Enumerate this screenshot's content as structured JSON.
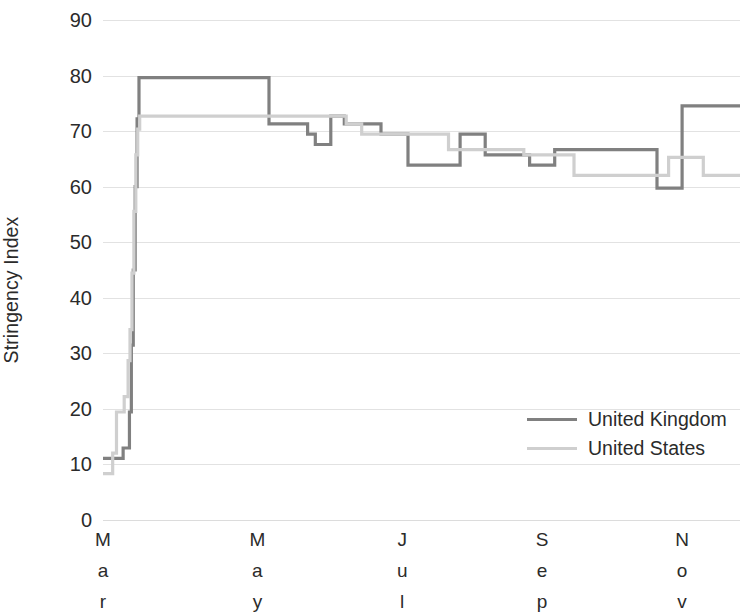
{
  "chart_data": {
    "type": "line",
    "title": "",
    "xlabel": "",
    "ylabel": "Stringency Index",
    "ylim": [
      0,
      90
    ],
    "y_ticks": [
      90,
      80,
      70,
      60,
      50,
      40,
      30,
      20,
      10,
      0
    ],
    "grid": true,
    "legend_position": "inside-right",
    "x_tick_labels": [
      "Mar",
      "May",
      "Jul",
      "Sep",
      "Nov"
    ],
    "x_tick_positions_frac": [
      0.0,
      0.2424,
      0.4697,
      0.6894,
      0.9091
    ],
    "x_range_label": "Mar 2020 - Nov 2020",
    "series": [
      {
        "name": "United Kingdom",
        "color": "#808080",
        "step": "post",
        "points": [
          [
            0.0,
            11.1
          ],
          [
            0.0286,
            11.1
          ],
          [
            0.0316,
            12.96
          ],
          [
            0.0385,
            12.96
          ],
          [
            0.0415,
            19.44
          ],
          [
            0.0445,
            31.48
          ],
          [
            0.0475,
            45.0
          ],
          [
            0.0505,
            60.0
          ],
          [
            0.0535,
            72.2
          ],
          [
            0.0565,
            79.63
          ],
          [
            0.2424,
            79.63
          ],
          [
            0.2545,
            79.63
          ],
          [
            0.2606,
            71.3
          ],
          [
            0.3091,
            71.3
          ],
          [
            0.3212,
            69.44
          ],
          [
            0.3333,
            67.59
          ],
          [
            0.3515,
            67.59
          ],
          [
            0.3576,
            72.69
          ],
          [
            0.3636,
            72.69
          ],
          [
            0.3788,
            71.3
          ],
          [
            0.4242,
            71.3
          ],
          [
            0.4364,
            69.44
          ],
          [
            0.4697,
            69.44
          ],
          [
            0.4788,
            63.89
          ],
          [
            0.5515,
            63.89
          ],
          [
            0.5606,
            69.44
          ],
          [
            0.5909,
            69.44
          ],
          [
            0.6,
            65.74
          ],
          [
            0.6591,
            65.74
          ],
          [
            0.6697,
            63.89
          ],
          [
            0.7,
            63.89
          ],
          [
            0.7091,
            66.67
          ],
          [
            0.7727,
            66.67
          ],
          [
            0.7848,
            66.67
          ],
          [
            0.8606,
            66.67
          ],
          [
            0.8697,
            59.72
          ],
          [
            0.9,
            59.72
          ],
          [
            0.9091,
            74.54
          ],
          [
            1.0,
            74.54
          ]
        ]
      },
      {
        "name": "United States",
        "color": "#cfcfcf",
        "step": "post",
        "points": [
          [
            0.0,
            8.33
          ],
          [
            0.0121,
            8.33
          ],
          [
            0.0152,
            12.04
          ],
          [
            0.0212,
            19.44
          ],
          [
            0.0303,
            19.44
          ],
          [
            0.0333,
            22.22
          ],
          [
            0.0394,
            28.7
          ],
          [
            0.0424,
            34.26
          ],
          [
            0.0455,
            44.44
          ],
          [
            0.0485,
            55.56
          ],
          [
            0.0515,
            65.74
          ],
          [
            0.0545,
            70.37
          ],
          [
            0.0576,
            72.69
          ],
          [
            0.2424,
            72.69
          ],
          [
            0.3,
            72.69
          ],
          [
            0.3394,
            72.69
          ],
          [
            0.3636,
            72.69
          ],
          [
            0.3818,
            71.3
          ],
          [
            0.4061,
            69.44
          ],
          [
            0.4545,
            69.44
          ],
          [
            0.4697,
            69.44
          ],
          [
            0.5303,
            69.44
          ],
          [
            0.5424,
            66.67
          ],
          [
            0.6515,
            66.67
          ],
          [
            0.6606,
            65.74
          ],
          [
            0.7273,
            65.74
          ],
          [
            0.7394,
            62.04
          ],
          [
            0.8788,
            62.04
          ],
          [
            0.8879,
            65.28
          ],
          [
            0.9333,
            65.28
          ],
          [
            0.9424,
            62.04
          ],
          [
            1.0,
            62.04
          ]
        ]
      }
    ]
  },
  "axis": {
    "y_title": "Stringency Index"
  },
  "legend": {
    "entries": [
      {
        "label": "United Kingdom",
        "color": "#808080"
      },
      {
        "label": "United States",
        "color": "#cfcfcf"
      }
    ]
  }
}
